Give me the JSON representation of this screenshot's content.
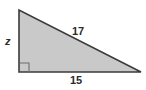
{
  "figure": {
    "type": "right-triangle",
    "colors": {
      "background": "#ffffff",
      "fill": "#c9c9c9",
      "stroke": "#3b3b3b",
      "right_angle_marker": "#6e6e6e",
      "label_text": "#2b2b2b"
    },
    "geometry": {
      "apex": [
        19,
        10
      ],
      "right_angle_vertex": [
        19,
        72
      ],
      "far_vertex": [
        141,
        72
      ],
      "right_angle_marker": {
        "x": 20,
        "y": 63,
        "size": 9
      }
    },
    "labels": {
      "vertical_leg": "z",
      "hypotenuse": "17",
      "horizontal_leg": "15"
    }
  }
}
